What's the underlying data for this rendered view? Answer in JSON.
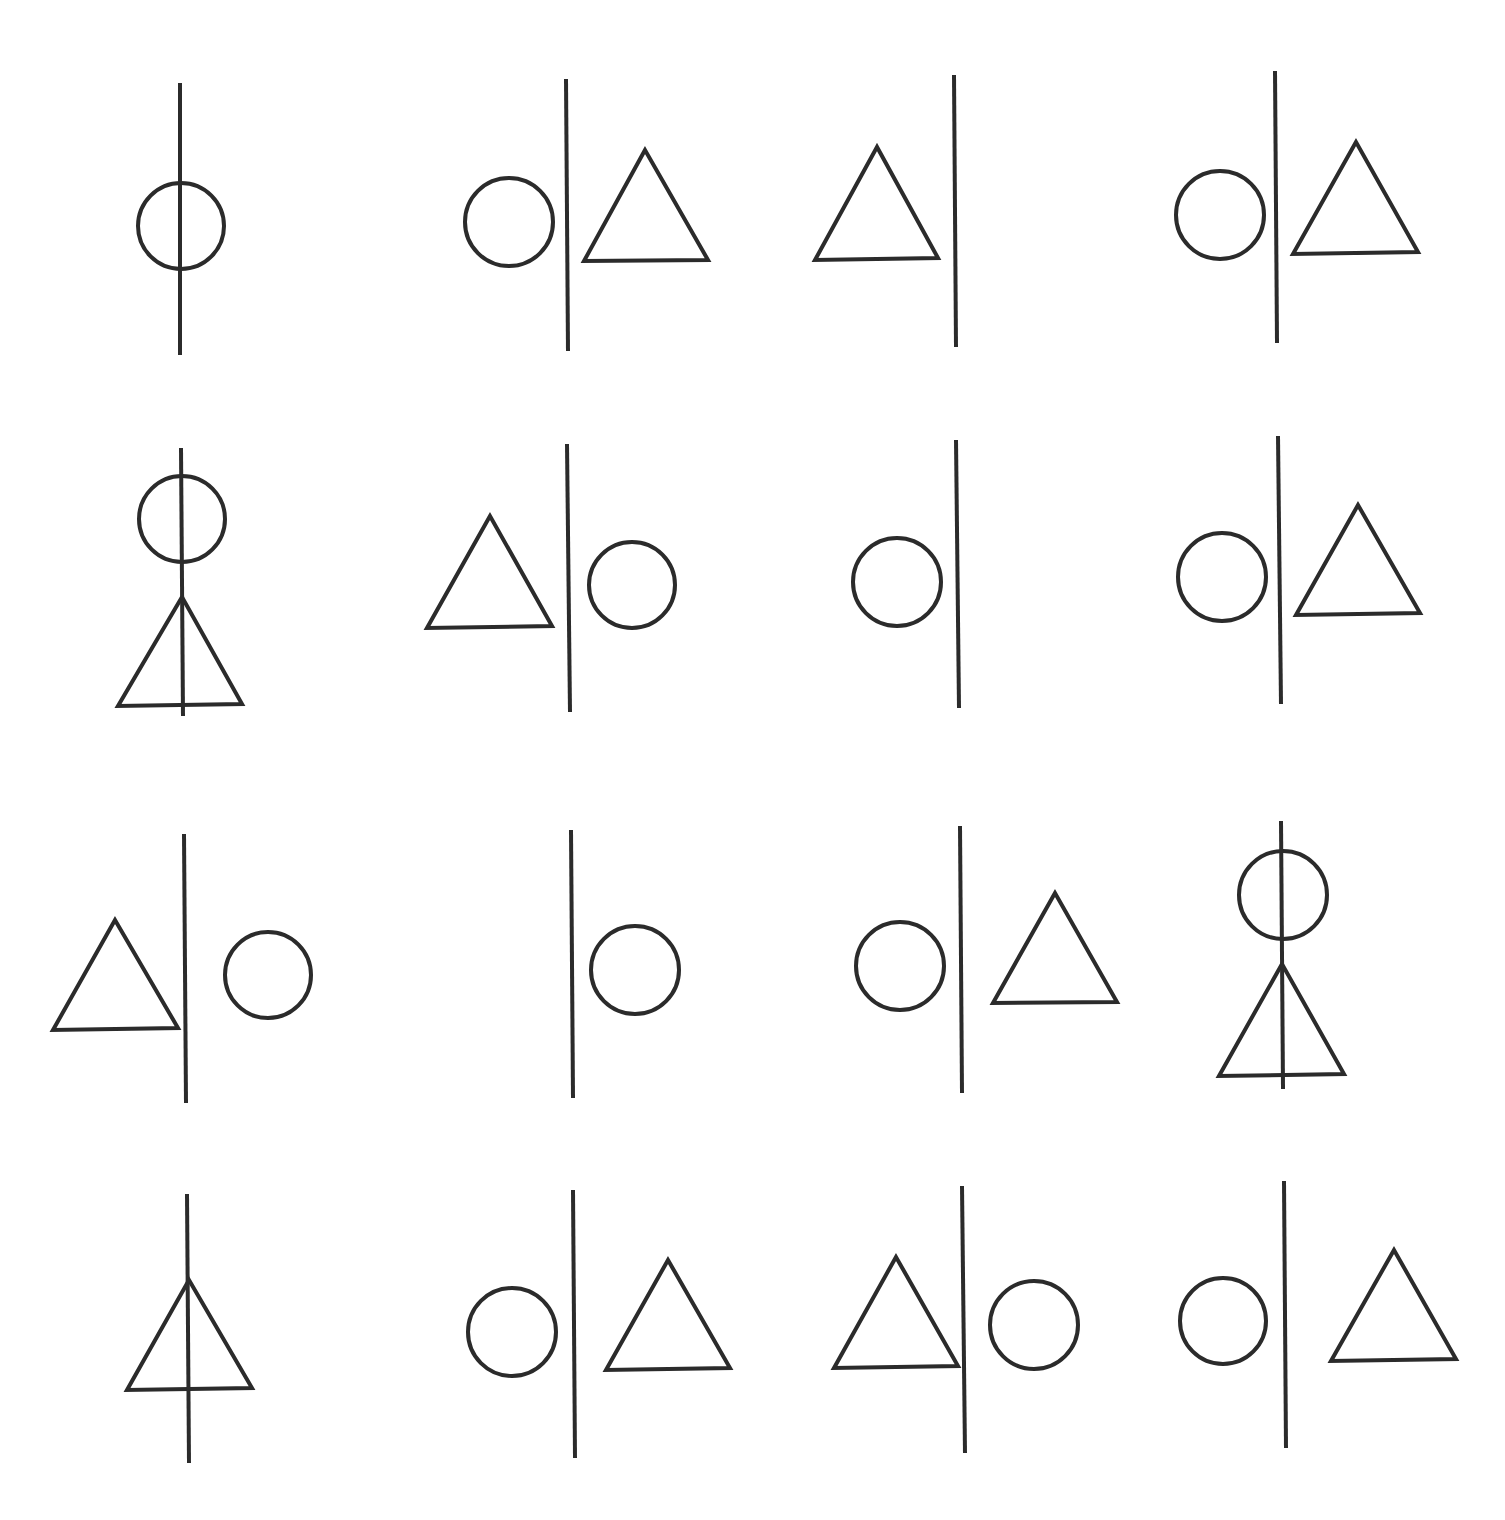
{
  "diagram": {
    "title": "",
    "layout": {
      "rows": 4,
      "cols": 4
    },
    "stroke_color": "#2b2b2b",
    "background": "#ffffff",
    "cells": [
      {
        "row": 1,
        "col": 1,
        "line": [
          180,
          83,
          180,
          355
        ],
        "circles": [
          [
            181,
            226,
            43
          ]
        ],
        "triangles": []
      },
      {
        "row": 1,
        "col": 2,
        "line": [
          566,
          79,
          568,
          351
        ],
        "circles": [
          [
            509,
            222,
            44
          ]
        ],
        "triangles": [
          [
            [
              645,
              150
            ],
            [
              584,
              261
            ],
            [
              708,
              260
            ]
          ]
        ]
      },
      {
        "row": 1,
        "col": 3,
        "line": [
          954,
          75,
          956,
          347
        ],
        "circles": [],
        "triangles": [
          [
            [
              877,
              147
            ],
            [
              815,
              260
            ],
            [
              938,
              258
            ]
          ]
        ]
      },
      {
        "row": 1,
        "col": 4,
        "line": [
          1275,
          71,
          1277,
          343
        ],
        "circles": [
          [
            1220,
            215,
            44
          ]
        ],
        "triangles": [
          [
            [
              1356,
              142
            ],
            [
              1293,
              254
            ],
            [
              1418,
              252
            ]
          ]
        ]
      },
      {
        "row": 2,
        "col": 1,
        "line": [
          181,
          448,
          183,
          716
        ],
        "circles": [
          [
            182,
            519,
            43
          ]
        ],
        "triangles": [
          [
            [
              182,
              597
            ],
            [
              118,
              706
            ],
            [
              242,
              704
            ]
          ]
        ]
      },
      {
        "row": 2,
        "col": 2,
        "line": [
          567,
          444,
          570,
          712
        ],
        "circles": [
          [
            632,
            585,
            43
          ]
        ],
        "triangles": [
          [
            [
              490,
              516
            ],
            [
              427,
              628
            ],
            [
              552,
              626
            ]
          ]
        ]
      },
      {
        "row": 2,
        "col": 3,
        "line": [
          956,
          440,
          959,
          708
        ],
        "circles": [
          [
            897,
            582,
            44
          ]
        ],
        "triangles": []
      },
      {
        "row": 2,
        "col": 4,
        "line": [
          1278,
          436,
          1281,
          704
        ],
        "circles": [
          [
            1222,
            577,
            44
          ]
        ],
        "triangles": [
          [
            [
              1358,
              505
            ],
            [
              1296,
              615
            ],
            [
              1420,
              613
            ]
          ]
        ]
      },
      {
        "row": 3,
        "col": 1,
        "line": [
          184,
          834,
          186,
          1103
        ],
        "circles": [
          [
            268,
            975,
            43
          ]
        ],
        "triangles": [
          [
            [
              115,
              920
            ],
            [
              53,
              1030
            ],
            [
              178,
              1028
            ]
          ]
        ]
      },
      {
        "row": 3,
        "col": 2,
        "line": [
          571,
          830,
          573,
          1098
        ],
        "circles": [
          [
            635,
            970,
            44
          ]
        ],
        "triangles": []
      },
      {
        "row": 3,
        "col": 3,
        "line": [
          960,
          826,
          962,
          1093
        ],
        "circles": [
          [
            900,
            966,
            44
          ]
        ],
        "triangles": [
          [
            [
              1055,
              893
            ],
            [
              993,
              1003
            ],
            [
              1117,
              1002
            ]
          ]
        ]
      },
      {
        "row": 3,
        "col": 4,
        "line": [
          1281,
          821,
          1283,
          1089
        ],
        "circles": [
          [
            1283,
            895,
            44
          ]
        ],
        "triangles": [
          [
            [
              1282,
              964
            ],
            [
              1219,
              1076
            ],
            [
              1344,
              1074
            ]
          ]
        ]
      },
      {
        "row": 4,
        "col": 1,
        "line": [
          187,
          1194,
          189,
          1463
        ],
        "circles": [],
        "triangles": [
          [
            [
              189,
              1280
            ],
            [
              127,
              1390
            ],
            [
              252,
              1388
            ]
          ]
        ]
      },
      {
        "row": 4,
        "col": 2,
        "line": [
          573,
          1190,
          575,
          1458
        ],
        "circles": [
          [
            512,
            1332,
            44
          ]
        ],
        "triangles": [
          [
            [
              668,
              1260
            ],
            [
              606,
              1370
            ],
            [
              730,
              1368
            ]
          ]
        ]
      },
      {
        "row": 4,
        "col": 3,
        "line": [
          962,
          1186,
          965,
          1453
        ],
        "circles": [
          [
            1034,
            1325,
            44
          ]
        ],
        "triangles": [
          [
            [
              896,
              1257
            ],
            [
              834,
              1368
            ],
            [
              958,
              1366
            ]
          ]
        ]
      },
      {
        "row": 4,
        "col": 4,
        "line": [
          1284,
          1181,
          1286,
          1448
        ],
        "circles": [
          [
            1223,
            1321,
            43
          ]
        ],
        "triangles": [
          [
            [
              1394,
              1250
            ],
            [
              1331,
              1361
            ],
            [
              1456,
              1359
            ]
          ]
        ]
      }
    ]
  }
}
